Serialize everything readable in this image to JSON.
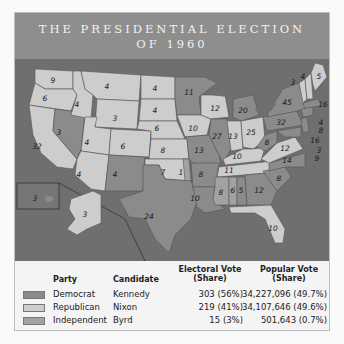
{
  "title": {
    "line1": "THE PRESIDENTIAL ELECTION",
    "line2": "OF 1960"
  },
  "colors": {
    "democrat": "#8b8b8b",
    "republican": "#cdcdcd",
    "independent": "#a2a2a2",
    "water": "#6f6f6f",
    "title_band": "#8e8e8e"
  },
  "legend": {
    "headers": {
      "party": "Party",
      "candidate": "Candidate",
      "electoral": "Electoral Vote (Share)",
      "electoral_l1": "Electoral Vote",
      "electoral_l2": "(Share)",
      "popular_l1": "Popular Vote",
      "popular_l2": "(Share)"
    },
    "rows": [
      {
        "party": "Democrat",
        "candidate": "Kennedy",
        "electoral": "303 (56%)",
        "popular": "34,227,096 (49.7%)"
      },
      {
        "party": "Republican",
        "candidate": "Nixon",
        "electoral": "219 (41%)",
        "popular": "34,107,646 (49.6%)"
      },
      {
        "party": "Independent",
        "candidate": "Byrd",
        "electoral": "15 (3%)",
        "popular": "501,643 (0.7%)"
      }
    ]
  },
  "states": [
    {
      "name": "Washington",
      "ev": "9",
      "party": "R"
    },
    {
      "name": "Oregon",
      "ev": "6",
      "party": "R"
    },
    {
      "name": "California",
      "ev": "32",
      "party": "R"
    },
    {
      "name": "Nevada",
      "ev": "3",
      "party": "D"
    },
    {
      "name": "Idaho",
      "ev": "4",
      "party": "R"
    },
    {
      "name": "Montana",
      "ev": "4",
      "party": "R"
    },
    {
      "name": "Wyoming",
      "ev": "3",
      "party": "R"
    },
    {
      "name": "Utah",
      "ev": "4",
      "party": "R"
    },
    {
      "name": "Arizona",
      "ev": "4",
      "party": "R"
    },
    {
      "name": "Colorado",
      "ev": "6",
      "party": "R"
    },
    {
      "name": "New Mexico",
      "ev": "4",
      "party": "D"
    },
    {
      "name": "North Dakota",
      "ev": "4",
      "party": "R"
    },
    {
      "name": "South Dakota",
      "ev": "4",
      "party": "R"
    },
    {
      "name": "Nebraska",
      "ev": "6",
      "party": "R"
    },
    {
      "name": "Kansas",
      "ev": "8",
      "party": "R"
    },
    {
      "name": "Oklahoma",
      "ev": "7",
      "party": "R"
    },
    {
      "name": "Oklahoma (Byrd)",
      "ev": "1",
      "party": "I"
    },
    {
      "name": "Texas",
      "ev": "24",
      "party": "D"
    },
    {
      "name": "Minnesota",
      "ev": "11",
      "party": "D"
    },
    {
      "name": "Iowa",
      "ev": "10",
      "party": "R"
    },
    {
      "name": "Missouri",
      "ev": "13",
      "party": "D"
    },
    {
      "name": "Arkansas",
      "ev": "8",
      "party": "D"
    },
    {
      "name": "Louisiana",
      "ev": "10",
      "party": "D"
    },
    {
      "name": "Wisconsin",
      "ev": "12",
      "party": "R"
    },
    {
      "name": "Illinois",
      "ev": "27",
      "party": "D"
    },
    {
      "name": "Michigan",
      "ev": "20",
      "party": "D"
    },
    {
      "name": "Indiana",
      "ev": "13",
      "party": "R"
    },
    {
      "name": "Ohio",
      "ev": "25",
      "party": "R"
    },
    {
      "name": "Kentucky",
      "ev": "10",
      "party": "R"
    },
    {
      "name": "Tennessee",
      "ev": "11",
      "party": "R"
    },
    {
      "name": "Mississippi",
      "ev": "8",
      "party": "I"
    },
    {
      "name": "Alabama (Kennedy)",
      "ev": "5",
      "party": "D"
    },
    {
      "name": "Alabama (Byrd)",
      "ev": "6",
      "party": "I"
    },
    {
      "name": "Georgia",
      "ev": "12",
      "party": "D"
    },
    {
      "name": "Florida",
      "ev": "10",
      "party": "R"
    },
    {
      "name": "South Carolina",
      "ev": "8",
      "party": "D"
    },
    {
      "name": "North Carolina",
      "ev": "14",
      "party": "D"
    },
    {
      "name": "Virginia",
      "ev": "12",
      "party": "R"
    },
    {
      "name": "West Virginia",
      "ev": "8",
      "party": "D"
    },
    {
      "name": "Pennsylvania",
      "ev": "32",
      "party": "D"
    },
    {
      "name": "New York",
      "ev": "45",
      "party": "D"
    },
    {
      "name": "Vermont",
      "ev": "3",
      "party": "R"
    },
    {
      "name": "New Hampshire",
      "ev": "4",
      "party": "R"
    },
    {
      "name": "Maine",
      "ev": "5",
      "party": "R"
    },
    {
      "name": "Massachusetts",
      "ev": "16",
      "party": "D"
    },
    {
      "name": "Rhode Island",
      "ev": "4",
      "party": "D"
    },
    {
      "name": "Connecticut",
      "ev": "8",
      "party": "D"
    },
    {
      "name": "New Jersey",
      "ev": "16",
      "party": "D"
    },
    {
      "name": "Delaware",
      "ev": "3",
      "party": "D"
    },
    {
      "name": "Maryland",
      "ev": "9",
      "party": "D"
    },
    {
      "name": "Alaska",
      "ev": "3",
      "party": "R"
    },
    {
      "name": "Hawaii",
      "ev": "3",
      "party": "D"
    }
  ]
}
